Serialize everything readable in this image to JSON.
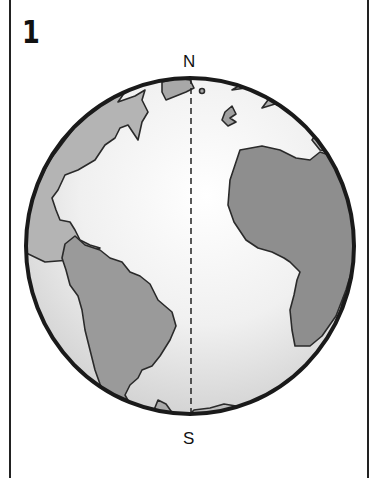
{
  "panel": {
    "number": "1"
  },
  "globe": {
    "north_label": "N",
    "south_label": "S",
    "meridian": "dashed-line",
    "continents": [
      "North America",
      "South America",
      "Europe",
      "Africa",
      "Antarctica"
    ]
  },
  "colors": {
    "outline": "#1a1a1a",
    "ocean": "#e9e9e9",
    "land_light": "#a9a9a9",
    "land_dark": "#8c8c8c",
    "background": "#ffffff"
  }
}
